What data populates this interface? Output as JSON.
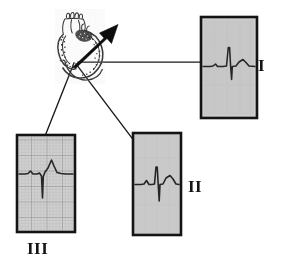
{
  "figure": {
    "kind": "ecg-cardiac-axis-diagram",
    "caption": "",
    "background_color": "#ffffff",
    "ink_color": "#1a1a1a",
    "trace_color": "#2b2b2b",
    "panel_fill": "#c9c9c9",
    "panel_fill_light": "#d2d2d2",
    "grid_color": "#a8a8a8",
    "panel_border_color": "#161616"
  },
  "heart": {
    "name": "heart-illustration",
    "description": "stippled line drawing of the heart with great vessels",
    "axis_arrow": {
      "name": "mean-electrical-axis-arrow",
      "description": "bold black arrow pointing up and to the right from the AV region",
      "color": "#111111",
      "tail_x": 73,
      "tail_y": 66,
      "head_x": 116,
      "head_y": 26
    }
  },
  "leads": [
    {
      "id": "lead-I",
      "label": "I",
      "label_position": "right",
      "panel": {
        "x": 201,
        "y": 17,
        "width": 56,
        "height": 101
      },
      "grid": false,
      "baseline_ratio": 0.52,
      "trace": {
        "description": "small r wave followed by deep narrow S wave, upright T",
        "r_amplitude": 0.1,
        "s_amplitude": -0.62,
        "t_amplitude": 0.08,
        "net_deflection": "negative"
      },
      "connector": {
        "from_x": 78,
        "from_y": 62,
        "to_x": 201,
        "to_y": 62
      }
    },
    {
      "id": "lead-II",
      "label": "II",
      "label_position": "right",
      "panel": {
        "x": 133,
        "y": 133,
        "width": 48,
        "height": 102
      },
      "grid": false,
      "baseline_ratio": 0.5,
      "trace": {
        "description": "small p wave, tall narrow R then deep S wave, broad T",
        "r_amplitude": 0.55,
        "s_amplitude": -0.55,
        "t_amplitude": 0.18,
        "net_deflection": "equiphasic"
      },
      "connector": {
        "from_x": 76,
        "from_y": 64,
        "to_x": 133,
        "to_y": 141
      }
    },
    {
      "id": "lead-III",
      "label": "III",
      "label_position": "below",
      "panel": {
        "x": 17,
        "y": 135,
        "width": 58,
        "height": 97
      },
      "grid": true,
      "baseline_ratio": 0.42,
      "trace": {
        "description": "small p wave, tall peaked R wave with deep narrow S wave below baseline",
        "r_amplitude": 0.7,
        "s_amplitude": -0.72,
        "t_amplitude": 0.06,
        "net_deflection": "positive"
      },
      "connector": {
        "from_x": 74,
        "from_y": 63,
        "to_x": 44,
        "to_y": 135
      }
    }
  ]
}
